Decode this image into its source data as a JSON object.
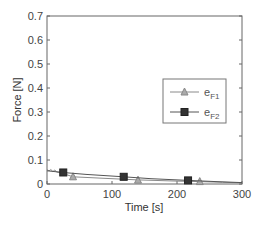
{
  "chart_data": {
    "type": "line",
    "title": "",
    "xlabel": "Time [s]",
    "ylabel": "Force [N]",
    "xlim": [
      0,
      300
    ],
    "ylim": [
      0,
      0.7
    ],
    "xticks": [
      0,
      100,
      200,
      300
    ],
    "yticks": [
      0,
      0.1,
      0.2,
      0.3,
      0.4,
      0.5,
      0.6,
      0.7
    ],
    "xtick_labels": [
      "0",
      "100",
      "200",
      "300"
    ],
    "ytick_labels": [
      "0",
      "0.1",
      "0.2",
      "0.3",
      "0.4",
      "0.5",
      "0.6",
      "0.7"
    ],
    "grid": false,
    "legend_position": "center-right",
    "series": [
      {
        "name": "eF1",
        "label_main": "e",
        "label_sub": "F1",
        "marker": "triangle",
        "color": "#8a8a8a",
        "line": [
          [
            0,
            0.06
          ],
          [
            3,
            0.055
          ],
          [
            6,
            0.06
          ],
          [
            9,
            0.052
          ],
          [
            12,
            0.058
          ],
          [
            15,
            0.05
          ],
          [
            20,
            0.048
          ],
          [
            40,
            0.03
          ],
          [
            100,
            0.022
          ],
          [
            140,
            0.017
          ],
          [
            200,
            0.012
          ],
          [
            235,
            0.01
          ],
          [
            270,
            0.007
          ],
          [
            300,
            0.005
          ]
        ],
        "x": [
          40,
          140,
          235
        ],
        "values": [
          0.03,
          0.016,
          0.01
        ]
      },
      {
        "name": "eF2",
        "label_main": "e",
        "label_sub": "F2",
        "marker": "square",
        "color": "#555555",
        "line": [
          [
            0,
            0.055
          ],
          [
            25,
            0.048
          ],
          [
            60,
            0.04
          ],
          [
            118,
            0.03
          ],
          [
            160,
            0.022
          ],
          [
            217,
            0.015
          ],
          [
            260,
            0.01
          ],
          [
            300,
            0.006
          ]
        ],
        "x": [
          25,
          118,
          217
        ],
        "values": [
          0.048,
          0.03,
          0.015
        ]
      }
    ]
  }
}
